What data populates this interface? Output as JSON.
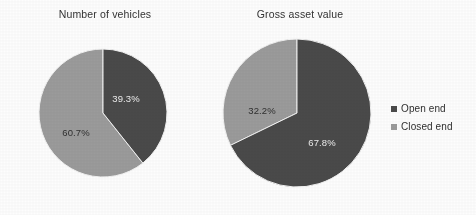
{
  "chart_data": [
    {
      "type": "pie",
      "title": "Number of vehicles",
      "categories": [
        "Open end",
        "Closed end"
      ],
      "values": [
        39.3,
        60.7
      ],
      "labels": [
        "39.3%",
        "60.7%"
      ],
      "unit": "%",
      "start_angle_deg": 0,
      "direction": "clockwise",
      "legend_position": "right",
      "grid": false,
      "xlabel": "",
      "ylabel": ""
    },
    {
      "type": "pie",
      "title": "Gross asset value",
      "categories": [
        "Open end",
        "Closed end"
      ],
      "values": [
        67.8,
        32.2
      ],
      "labels": [
        "67.8%",
        "32.2%"
      ],
      "unit": "%",
      "start_angle_deg": 0,
      "direction": "clockwise",
      "legend_position": "right",
      "grid": false,
      "xlabel": "",
      "ylabel": ""
    }
  ],
  "colors": {
    "open_end": "#4a4a4a",
    "closed_end": "#9b9b9b",
    "background": "#fdfdfd",
    "text": "#2f2f2f",
    "label_on_dark": "#ededed",
    "label_on_light": "#2f2f2f",
    "slice_divider": "#f2f2f2"
  },
  "legend": {
    "items": [
      {
        "label": "Open end",
        "swatch": "#4a4a4a"
      },
      {
        "label": "Closed end",
        "swatch": "#9b9b9b"
      }
    ]
  }
}
